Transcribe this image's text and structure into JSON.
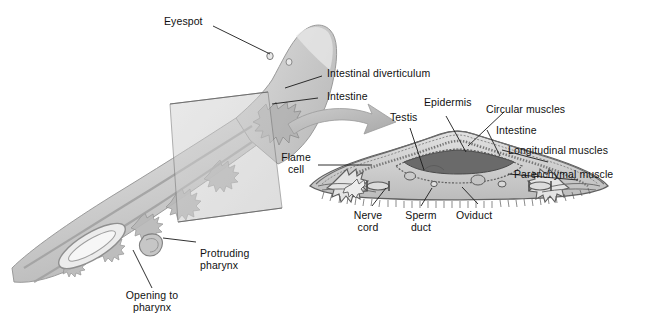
{
  "figure": {
    "background": "#ffffff",
    "text_color": "#111111",
    "leader_color": "#1a1a1a",
    "body_fill": "#d8d8d8",
    "body_stroke": "#8f8f8f",
    "plane_fill": "#c9c9c9",
    "arrow_fill": "#b6b6b6",
    "section_fill": "#d2d2d2",
    "section_stroke": "#6e6e6e"
  },
  "labels": {
    "eyespot": "Eyespot",
    "intestinal_diverticulum": "Intestinal diverticulum",
    "intestine_whole": "Intestine",
    "protruding_pharynx_l1": "Protruding",
    "protruding_pharynx_l2": "pharynx",
    "opening_to_pharynx_l1": "Opening to",
    "opening_to_pharynx_l2": "pharynx",
    "flame_cell_l1": "Flame",
    "flame_cell_l2": "cell",
    "testis": "Testis",
    "epidermis": "Epidermis",
    "circular_muscles": "Circular muscles",
    "intestine_section": "Intestine",
    "longitudinal_muscles": "Longitudinal muscles",
    "parenchymal_muscle": "Parenchymal muscle",
    "nerve_cord_l1": "Nerve",
    "nerve_cord_l2": "cord",
    "sperm_duct_l1": "Sperm",
    "sperm_duct_l2": "duct",
    "oviduct": "Oviduct"
  },
  "structures": {
    "whole_body": "planarian body, dorsolateral view, cut by a transverse plane",
    "cut_plane": "transparent sectioning plane",
    "pointer_arrow": "curved arrow from whole body to magnified cross-section",
    "cross_section": "transverse cross-section of planarian"
  }
}
